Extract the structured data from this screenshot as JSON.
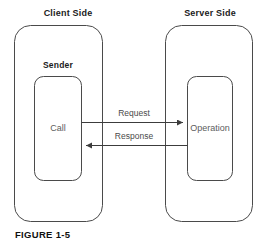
{
  "figure": {
    "caption": "FIGURE 1-5",
    "background_color": "#ffffff",
    "stroke_color": "#4a4a4a",
    "title_color": "#1b1b1b",
    "body_text_color": "#5d5d5d"
  },
  "client": {
    "title": "Client Side",
    "group_title": "Sender",
    "inner_label": "Call"
  },
  "server": {
    "title": "Server Side",
    "inner_label": "Operation"
  },
  "arrows": [
    {
      "label": "Request",
      "direction": "right",
      "from": "Call",
      "to": "Operation"
    },
    {
      "label": "Response",
      "direction": "left",
      "from": "Operation",
      "to": "Call"
    }
  ]
}
